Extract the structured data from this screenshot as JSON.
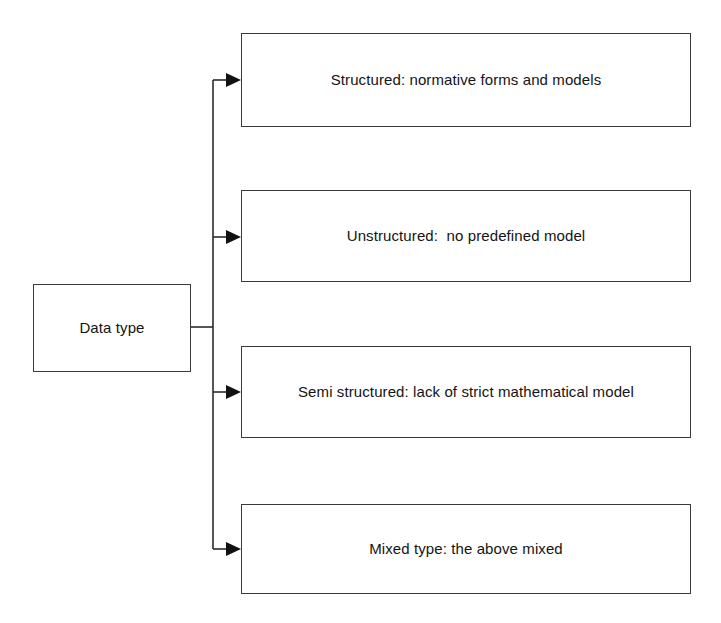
{
  "diagram": {
    "title": "Data type",
    "type": "tree",
    "root": {
      "label": "Data type"
    },
    "branches": [
      {
        "label": "Structured: normative forms and models"
      },
      {
        "label": "Unstructured:  no predefined model"
      },
      {
        "label": "Semi structured: lack of strict mathematical model"
      },
      {
        "label": "Mixed type: the above mixed"
      }
    ],
    "style": {
      "background": "#ffffff",
      "box_border": "#3a3a3a",
      "connector": "#2b2b2b",
      "text": "#141414"
    },
    "connectors": {
      "arrow_icon": "arrowhead-right-icon",
      "count": 4
    }
  }
}
